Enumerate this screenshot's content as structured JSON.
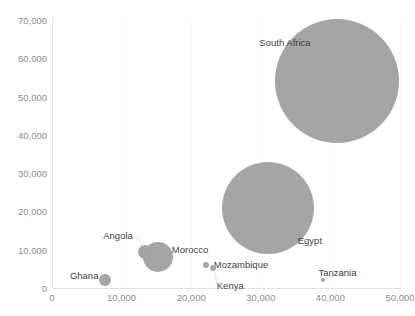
{
  "chart_title": "",
  "axes": {
    "y_ticks": [
      "70,000",
      "60,000",
      "50,000",
      "40,000",
      "30,000",
      "20,000",
      "10,000",
      "0"
    ],
    "x_ticks": [
      "0",
      "10,000",
      "20,000",
      "30,000",
      "40,000",
      "50,000"
    ],
    "xlabel": "",
    "ylabel": ""
  },
  "labels": {
    "south_africa": "South Africa",
    "egypt": "Egypt",
    "morocco": "Morocco",
    "angola": "Angola",
    "ghana": "Ghana",
    "mozambique": "Mozambique",
    "kenya": "Kenya",
    "tanzania": "Tanzania"
  },
  "colors": {
    "bubble": "#a5a5a5",
    "tick_text": "#8d8d8d",
    "label_text": "#3f3f3f",
    "axis_line": "#e2e2e4",
    "gridline": "#fbfbfc",
    "background": "#ffffff"
  },
  "chart_data": {
    "type": "scatter",
    "title": "",
    "xlabel": "",
    "ylabel": "",
    "xlim": [
      0,
      50000
    ],
    "ylim": [
      0,
      70000
    ],
    "x_ticks": [
      0,
      10000,
      20000,
      30000,
      40000,
      50000
    ],
    "y_ticks": [
      0,
      10000,
      20000,
      30000,
      40000,
      50000,
      60000,
      70000
    ],
    "grid": true,
    "legend": "none",
    "bubble_color": "#a5a5a5",
    "points": [
      {
        "name": "South Africa",
        "x": 41000,
        "y": 54000,
        "size": 62,
        "label_dx": -78,
        "label_dy": -44
      },
      {
        "name": "Egypt",
        "x": 31000,
        "y": 21000,
        "size": 46,
        "label_dx": 30,
        "label_dy": 27
      },
      {
        "name": "Morocco",
        "x": 15200,
        "y": 8200,
        "size": 15,
        "label_dx": 14,
        "label_dy": -13
      },
      {
        "name": "Angola",
        "x": 13400,
        "y": 9500,
        "size": 7,
        "label_dx": -42,
        "label_dy": -22
      },
      {
        "name": "Ghana",
        "x": 7600,
        "y": 2100,
        "size": 6,
        "label_dx": -35,
        "label_dy": -10
      },
      {
        "name": "Mozambique",
        "x": 22100,
        "y": 6000,
        "size": 3,
        "label_dx": 8,
        "label_dy": -6
      },
      {
        "name": "Kenya",
        "x": 23100,
        "y": 5300,
        "size": 3,
        "label_dx": 4,
        "label_dy": 12
      },
      {
        "name": "Tanzania",
        "x": 39000,
        "y": 2100,
        "size": 2,
        "label_dx": -5,
        "label_dy": -13
      }
    ]
  }
}
